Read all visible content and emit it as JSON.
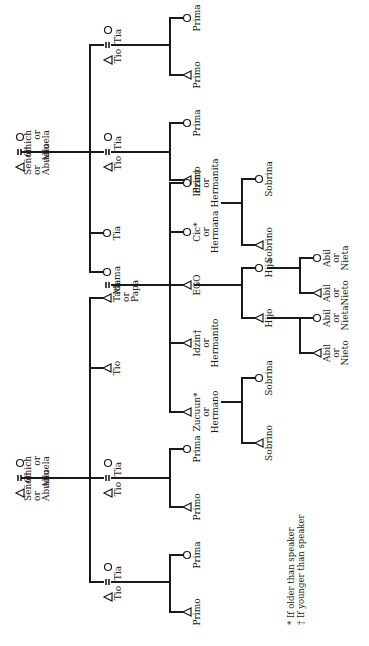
{
  "diagram": {
    "orientation": "rotated 90 degrees counter-clockwise (text reads bottom-to-top)",
    "symbols": {
      "male": "triangle",
      "female": "circle",
      "marriage": "equals-sign"
    },
    "colors": {
      "ink": "#1a1a1a",
      "background": "#ffffff"
    }
  },
  "generations": {
    "grandparents": {
      "paternal": {
        "male": [
          "Señor",
          "or",
          "Abuelo"
        ],
        "female": [
          "Chich",
          "or",
          "Abuela"
        ]
      },
      "maternal": {
        "male": [
          "Señor",
          "or",
          "Abuelo"
        ],
        "female": [
          "Chich",
          "or",
          "Abuela"
        ]
      }
    },
    "parents_generation": {
      "maternal_side": [
        {
          "male": "Tio",
          "female": "Tia"
        },
        {
          "male": "Tio",
          "female": "Tia"
        },
        {
          "female": "Tia"
        },
        {
          "female": "Mama"
        }
      ],
      "father": [
        "Tata",
        "or",
        "Papa"
      ],
      "paternal_side": [
        {
          "male": "Tio"
        },
        {
          "male": "Tio",
          "female": "Tia"
        },
        {
          "male": "Tio",
          "female": "Tia"
        }
      ]
    },
    "ego_generation": {
      "cousins_top_1": {
        "female": "Prima",
        "male": "Primo"
      },
      "cousins_top_2": {
        "female": "Prima",
        "male": "Primo"
      },
      "siblings": [
        {
          "sex": "female",
          "label": [
            "Idzin†",
            "or",
            "Hermanita"
          ]
        },
        {
          "sex": "female",
          "label": [
            "Cic*",
            "or",
            "Hermana"
          ]
        },
        {
          "sex": "male",
          "label": [
            "EGO"
          ]
        },
        {
          "sex": "male",
          "label": [
            "Idzin†",
            "or",
            "Hermanito"
          ]
        },
        {
          "sex": "male",
          "label": [
            "Zucuun*",
            "or",
            "Hermano"
          ]
        }
      ],
      "cousins_bottom_1": {
        "female": "Prima",
        "male": "Primo"
      },
      "cousins_bottom_2": {
        "female": "Prima",
        "male": "Primo"
      }
    },
    "children_generation": {
      "sister_children": {
        "female": "Sobrina",
        "male": "Sobrino"
      },
      "ego_children": {
        "daughter": "Hija",
        "son": "Hijo"
      },
      "brother_children": {
        "female": "Sobrina",
        "male": "Sobrino"
      }
    },
    "grandchildren": {
      "via_daughter": [
        [
          "Abil",
          "or",
          "Nieta"
        ],
        [
          "Abil",
          "or",
          "Nieto"
        ]
      ],
      "via_son": [
        [
          "Abil",
          "or",
          "Nieta"
        ],
        [
          "Abil",
          "or",
          "Nieto"
        ]
      ]
    }
  },
  "footnotes": [
    "* If older than speaker",
    "† If younger than speaker"
  ]
}
